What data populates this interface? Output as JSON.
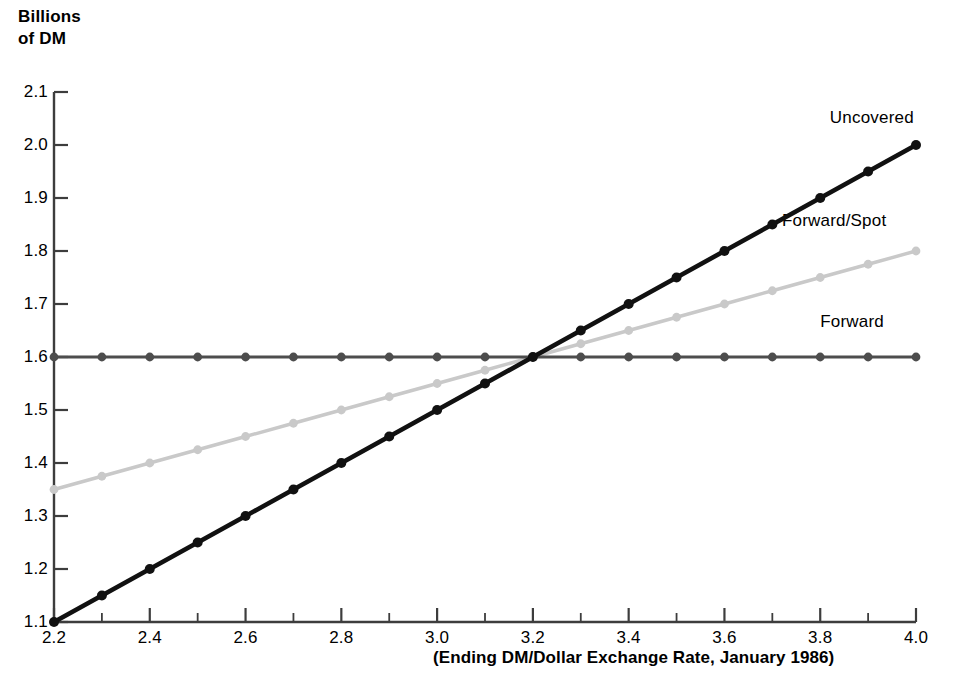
{
  "chart_data": {
    "type": "line",
    "title": "",
    "subtitle": "",
    "ylabel": "Billions\nof DM",
    "xlabel": "(Ending DM/Dollar Exchange Rate, January 1986)",
    "xlim": [
      2.2,
      4.0
    ],
    "ylim": [
      1.1,
      2.1
    ],
    "grid": false,
    "legend_position": "inline-right-of-series",
    "x_tick_labels": [
      "2.2",
      "2.4",
      "2.6",
      "2.8",
      "3.0",
      "3.2",
      "3.4",
      "3.6",
      "3.8",
      "4.0"
    ],
    "x_tick_values": [
      2.2,
      2.4,
      2.6,
      2.8,
      3.0,
      3.2,
      3.4,
      3.6,
      3.8,
      4.0
    ],
    "x_minor_tick_values": [
      2.3,
      2.5,
      2.7,
      2.9,
      3.1,
      3.3,
      3.5,
      3.7,
      3.9
    ],
    "y_tick_labels": [
      "2.1",
      "2.0",
      "1.9",
      "1.8",
      "1.7",
      "1.6",
      "1.5",
      "1.4",
      "1.3",
      "1.2",
      "1.1"
    ],
    "y_tick_values": [
      2.1,
      2.0,
      1.9,
      1.8,
      1.7,
      1.6,
      1.5,
      1.4,
      1.3,
      1.2,
      1.1
    ],
    "x": [
      2.2,
      2.3,
      2.4,
      2.5,
      2.6,
      2.7,
      2.8,
      2.9,
      3.0,
      3.1,
      3.2,
      3.3,
      3.4,
      3.5,
      3.6,
      3.7,
      3.8,
      3.9,
      4.0
    ],
    "series": [
      {
        "name": "Uncovered",
        "color": "#111111",
        "values": [
          1.1,
          1.15,
          1.2,
          1.25,
          1.3,
          1.35,
          1.4,
          1.45,
          1.5,
          1.55,
          1.6,
          1.65,
          1.7,
          1.75,
          1.8,
          1.85,
          1.9,
          1.95,
          2.0
        ],
        "label_x": 3.82,
        "label_y": 2.05
      },
      {
        "name": "Forward/Spot",
        "color": "#c9c9c9",
        "values": [
          1.35,
          1.375,
          1.4,
          1.425,
          1.45,
          1.475,
          1.5,
          1.525,
          1.55,
          1.575,
          1.6,
          1.625,
          1.65,
          1.675,
          1.7,
          1.725,
          1.75,
          1.775,
          1.8
        ],
        "label_x": 3.72,
        "label_y": 1.855
      },
      {
        "name": "Forward",
        "color": "#4d4d4d",
        "values": [
          1.6,
          1.6,
          1.6,
          1.6,
          1.6,
          1.6,
          1.6,
          1.6,
          1.6,
          1.6,
          1.6,
          1.6,
          1.6,
          1.6,
          1.6,
          1.6,
          1.6,
          1.6,
          1.6
        ],
        "label_x": 3.8,
        "label_y": 1.665
      }
    ],
    "intersection": {
      "x": 3.2,
      "y": 1.6
    }
  },
  "axis": {
    "color": "#3d3d3d"
  }
}
